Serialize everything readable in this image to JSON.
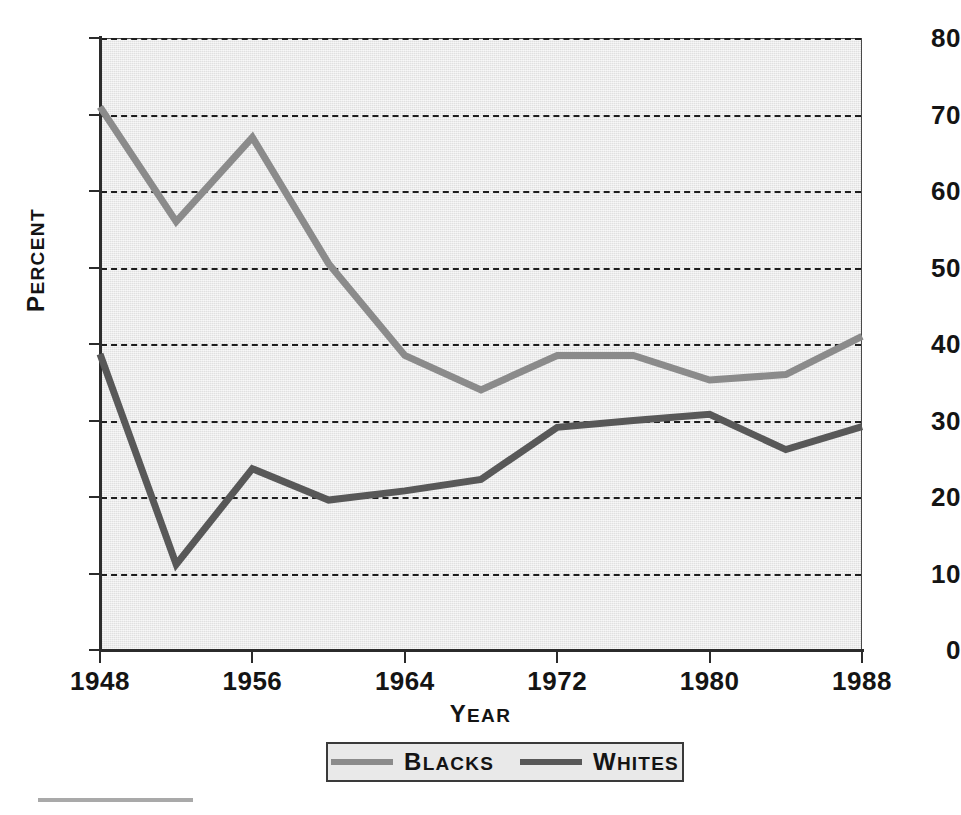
{
  "chart_data": {
    "type": "line",
    "title": "",
    "xlabel": "Year",
    "ylabel": "Percent",
    "xlim": [
      1948,
      1988
    ],
    "ylim": [
      0,
      80
    ],
    "grid": true,
    "legend_position": "bottom-center",
    "x": [
      1948,
      1952,
      1956,
      1960,
      1964,
      1968,
      1972,
      1976,
      1980,
      1984,
      1988
    ],
    "xticks": [
      1948,
      1956,
      1964,
      1972,
      1980,
      1988
    ],
    "xtick_labels": [
      "1948",
      "1956",
      "1964",
      "1972",
      "1980",
      "1988"
    ],
    "yticks": [
      0,
      10,
      20,
      30,
      40,
      50,
      60,
      70,
      80
    ],
    "ytick_labels": [
      "0",
      "10",
      "20",
      "30",
      "40",
      "50",
      "60",
      "70",
      "80"
    ],
    "series": [
      {
        "name": "Blacks",
        "color": "#8b8b8b",
        "values": [
          71,
          56,
          67,
          50.5,
          38.5,
          34,
          38.5,
          38.5,
          35.3,
          36,
          41
        ]
      },
      {
        "name": "Whites",
        "color": "#585858",
        "values": [
          38.7,
          11.2,
          23.7,
          19.6,
          20.8,
          22.3,
          29.1,
          30,
          30.8,
          26.2,
          29.2
        ]
      }
    ]
  },
  "axes": {
    "y_title": "Percent",
    "y_title_initial": "P",
    "y_title_rest": "ERCENT",
    "x_title_initial": "Y",
    "x_title_rest": "EAR"
  },
  "legend": {
    "entries": [
      {
        "initial": "B",
        "rest": "LACKS",
        "label": "Blacks",
        "swatch_color": "#8b8b8b"
      },
      {
        "initial": "W",
        "rest": "HITES",
        "label": "Whites",
        "swatch_color": "#585858"
      }
    ]
  },
  "colors": {
    "plot_background": "#e9e9e9",
    "axis": "#2b2b2b",
    "grid": "#1e1e1e",
    "blacks_line": "#8b8b8b",
    "whites_line": "#585858"
  }
}
